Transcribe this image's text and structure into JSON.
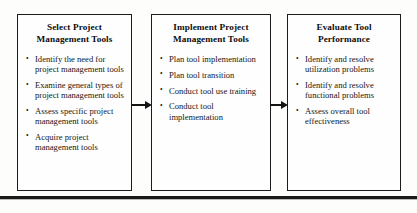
{
  "diagram": {
    "type": "process-flow",
    "background_color": "#fdfdfc",
    "line_color": "#1a1a1a",
    "boxes": [
      {
        "id": "select-project-management-tools",
        "title_lines": [
          "Select Project",
          "Management Tools"
        ],
        "bullets": [
          "Identify the need for project management tools",
          "Examine general types of project management tools",
          "Assess specific project management tools",
          "Acquire project management tools"
        ]
      },
      {
        "id": "implement-project-management-tools",
        "title_lines": [
          "Implement Project",
          "Management Tools"
        ],
        "bullets": [
          "Plan tool implementation",
          "Plan tool transition",
          "Conduct tool use training",
          "Conduct tool implementation"
        ]
      },
      {
        "id": "evaluate-tool-performance",
        "title_lines": [
          "Evaluate Tool",
          "Performance"
        ],
        "bullets": [
          "Identify and resolve utilization problems",
          "Identify and resolve functional problems",
          "Assess overall tool effectiveness"
        ]
      }
    ],
    "connectors": [
      {
        "id": "arrow-box1-to-box2",
        "from": "select-project-management-tools",
        "to": "implement-project-management-tools",
        "direction": "right"
      },
      {
        "id": "arrow-box2-to-box3",
        "from": "implement-project-management-tools",
        "to": "evaluate-tool-performance",
        "direction": "right"
      }
    ]
  }
}
